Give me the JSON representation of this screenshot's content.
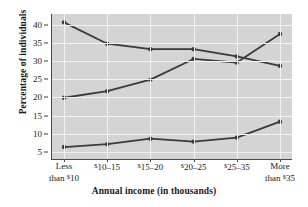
{
  "chart_data": {
    "type": "line",
    "title": "",
    "xlabel": "Annual income (in thousands)",
    "ylabel": "Percentage of individuals",
    "categories": [
      "Less than $10",
      "$10–15",
      "$15–20",
      "$20–25",
      "$25–35",
      "More than $35"
    ],
    "category_lines": [
      [
        "Less",
        "than $10"
      ],
      [
        "$10–15"
      ],
      [
        "$15–20"
      ],
      [
        "$20–25"
      ],
      [
        "$25–35"
      ],
      [
        "More",
        "than $35"
      ]
    ],
    "ylim": [
      3,
      43
    ],
    "yticks": [
      5,
      10,
      15,
      20,
      25,
      30,
      35,
      40
    ],
    "ytick_labels": [
      "5",
      "10",
      "15",
      "20",
      "25",
      "30",
      "35",
      "40"
    ],
    "grid": true,
    "legend": "none",
    "series": [
      {
        "name": "series-1",
        "values": [
          40.7,
          34.8,
          33.3,
          33.3,
          31.3,
          28.7
        ],
        "color": "#3a3a3a"
      },
      {
        "name": "series-2",
        "values": [
          19.9,
          21.7,
          24.9,
          30.6,
          29.6,
          37.5
        ],
        "color": "#3a3a3a"
      },
      {
        "name": "series-3",
        "values": [
          6.3,
          7.1,
          8.6,
          7.8,
          8.9,
          13.3
        ],
        "color": "#3a3a3a"
      }
    ],
    "colors": {
      "plot_background": "#d4d4d4",
      "grid": "#f2f2f2",
      "line": "#3a3a3a",
      "axis": "#4a4a4a",
      "text": "#1a1a1a"
    }
  }
}
